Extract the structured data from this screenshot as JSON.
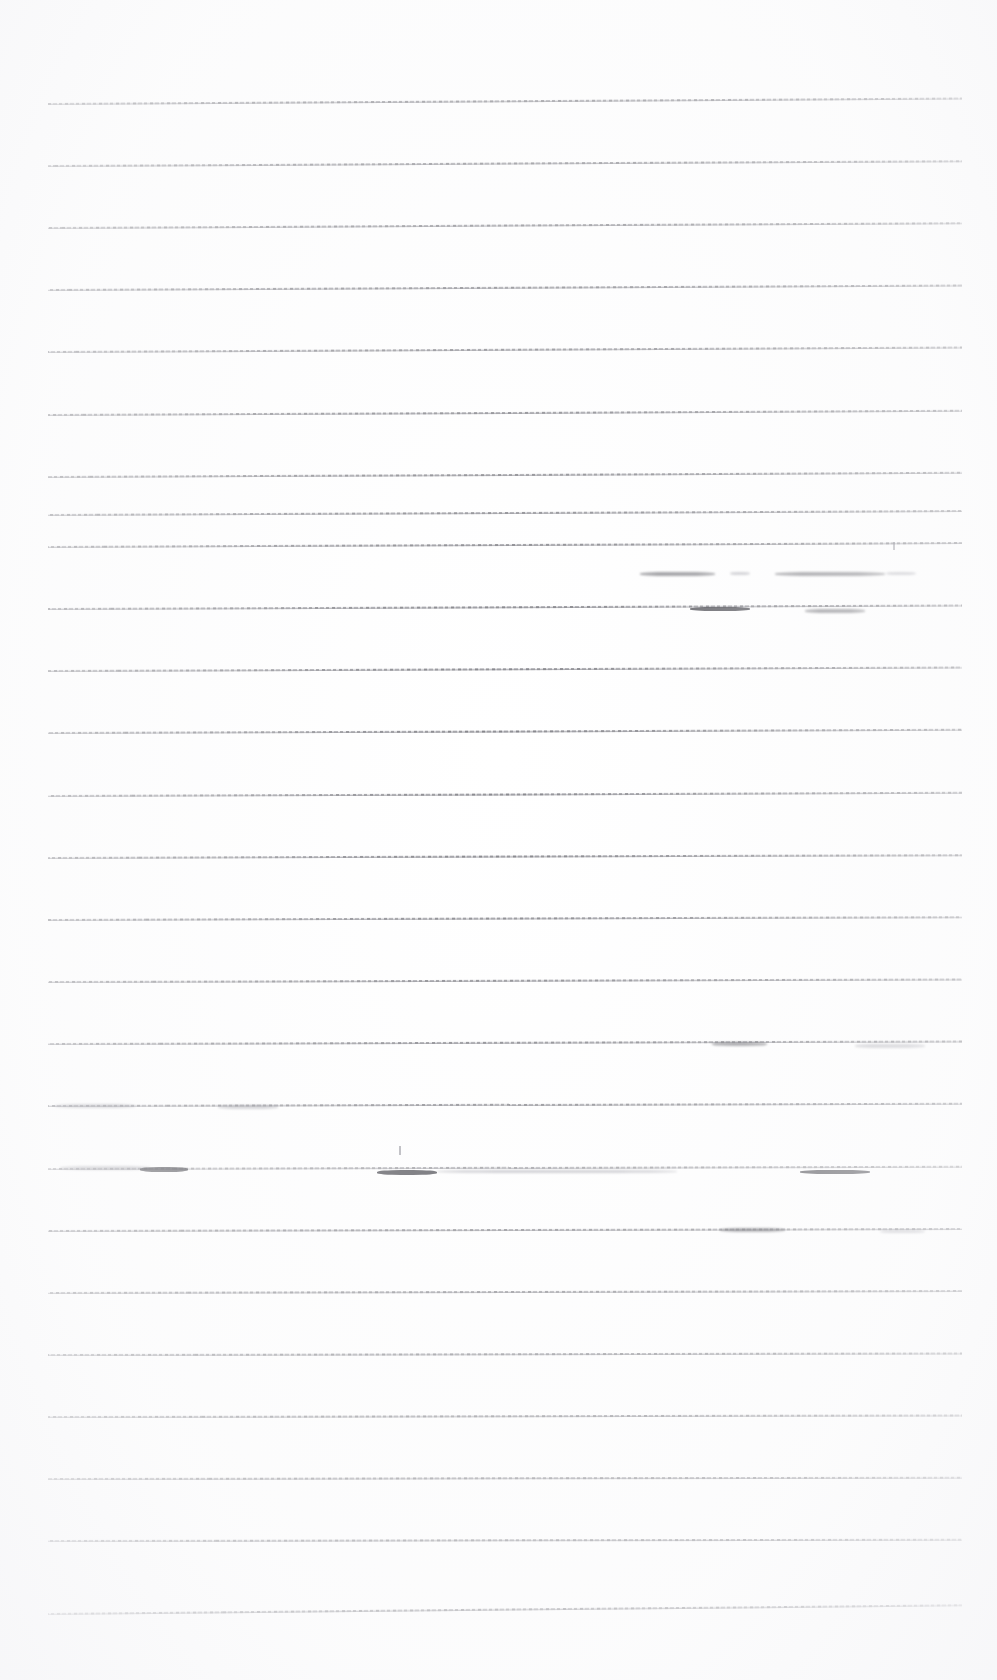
{
  "document": {
    "kind": "scanned-ruled-paper",
    "title": "Blank ruled notebook page (scan)",
    "page_width": 997,
    "page_height": 1680,
    "background_color": "#ffffff",
    "ink_color": "#46464e",
    "text_content": "",
    "visible_text": []
  },
  "ruling": {
    "description": "Horizontal ruled lines, faint grey, slightly skewed",
    "line_count": 25,
    "left_margin_x": 48,
    "right_margin_x": 962,
    "first_line_y": 103,
    "line_spacing": 62.1,
    "line_color": "#46464e",
    "line_thickness": 1
  },
  "lines": [
    {
      "id": "rule-1",
      "y": 103,
      "x1": 48,
      "x2": 962,
      "skew": -0.35,
      "opacity": 0.8,
      "segments": []
    },
    {
      "id": "rule-2",
      "y": 165,
      "x1": 48,
      "x2": 962,
      "skew": -0.3,
      "opacity": 0.78,
      "segments": []
    },
    {
      "id": "rule-3",
      "y": 227,
      "x1": 48,
      "x2": 962,
      "skew": -0.3,
      "opacity": 0.76,
      "segments": []
    },
    {
      "id": "rule-4",
      "y": 289,
      "x1": 48,
      "x2": 962,
      "skew": -0.28,
      "opacity": 0.78,
      "segments": []
    },
    {
      "id": "rule-5",
      "y": 351,
      "x1": 48,
      "x2": 962,
      "skew": -0.28,
      "opacity": 0.74,
      "segments": []
    },
    {
      "id": "rule-6",
      "y": 414,
      "x1": 48,
      "x2": 962,
      "skew": -0.26,
      "opacity": 0.76,
      "segments": []
    },
    {
      "id": "rule-7",
      "y": 476,
      "x1": 48,
      "x2": 962,
      "skew": -0.26,
      "opacity": 0.74,
      "segments": []
    },
    {
      "id": "rule-8",
      "y": 514,
      "x1": 48,
      "x2": 962,
      "skew": -0.25,
      "opacity": 0.72,
      "segments": []
    },
    {
      "id": "rule-9",
      "y": 546,
      "x1": 48,
      "x2": 962,
      "skew": -0.25,
      "opacity": 0.74,
      "segments": []
    },
    {
      "id": "rule-10",
      "y": 608,
      "x1": 48,
      "x2": 962,
      "skew": -0.22,
      "opacity": 0.76,
      "segments": []
    },
    {
      "id": "rule-11",
      "y": 670,
      "x1": 48,
      "x2": 962,
      "skew": -0.22,
      "opacity": 0.74,
      "segments": []
    },
    {
      "id": "rule-12",
      "y": 732,
      "x1": 48,
      "x2": 962,
      "skew": -0.2,
      "opacity": 0.74,
      "segments": []
    },
    {
      "id": "rule-13",
      "y": 795,
      "x1": 48,
      "x2": 962,
      "skew": -0.2,
      "opacity": 0.72,
      "segments": []
    },
    {
      "id": "rule-14",
      "y": 857,
      "x1": 48,
      "x2": 962,
      "skew": -0.18,
      "opacity": 0.74,
      "segments": []
    },
    {
      "id": "rule-15",
      "y": 919,
      "x1": 48,
      "x2": 962,
      "skew": -0.18,
      "opacity": 0.72,
      "segments": []
    },
    {
      "id": "rule-16",
      "y": 981,
      "x1": 48,
      "x2": 962,
      "skew": -0.16,
      "opacity": 0.72,
      "segments": []
    },
    {
      "id": "rule-17",
      "y": 1043,
      "x1": 48,
      "x2": 962,
      "skew": -0.16,
      "opacity": 0.74,
      "segments": []
    },
    {
      "id": "rule-18",
      "y": 1105,
      "x1": 48,
      "x2": 962,
      "skew": -0.14,
      "opacity": 0.72,
      "segments": []
    },
    {
      "id": "rule-19",
      "y": 1168,
      "x1": 48,
      "x2": 962,
      "skew": -0.14,
      "opacity": 0.6,
      "segments": []
    },
    {
      "id": "rule-20",
      "y": 1230,
      "x1": 48,
      "x2": 962,
      "skew": -0.12,
      "opacity": 0.72,
      "segments": []
    },
    {
      "id": "rule-21",
      "y": 1292,
      "x1": 48,
      "x2": 962,
      "skew": -0.12,
      "opacity": 0.72,
      "segments": []
    },
    {
      "id": "rule-22",
      "y": 1354,
      "x1": 48,
      "x2": 962,
      "skew": -0.1,
      "opacity": 0.72,
      "segments": []
    },
    {
      "id": "rule-23",
      "y": 1416,
      "x1": 48,
      "x2": 962,
      "skew": -0.1,
      "opacity": 0.72,
      "segments": []
    },
    {
      "id": "rule-24",
      "y": 1478,
      "x1": 48,
      "x2": 962,
      "skew": -0.08,
      "opacity": 0.72,
      "segments": []
    },
    {
      "id": "rule-25",
      "y": 1540,
      "x1": 48,
      "x2": 962,
      "skew": -0.08,
      "opacity": 0.72,
      "segments": []
    },
    {
      "id": "rule-26",
      "y": 1613,
      "x1": 48,
      "x2": 962,
      "skew": -0.55,
      "opacity": 0.7,
      "segments": []
    }
  ],
  "marks": [
    {
      "id": "smudge-1",
      "kind": "smudge",
      "x": 640,
      "y": 572,
      "w": 75,
      "h": 4,
      "weight": "normal"
    },
    {
      "id": "smudge-2",
      "kind": "smudge",
      "x": 730,
      "y": 572,
      "w": 20,
      "h": 3,
      "weight": "light"
    },
    {
      "id": "smudge-3",
      "kind": "smudge",
      "x": 775,
      "y": 572,
      "w": 110,
      "h": 4,
      "weight": "normal"
    },
    {
      "id": "smudge-4",
      "kind": "smudge",
      "x": 886,
      "y": 572,
      "w": 30,
      "h": 3,
      "weight": "light"
    },
    {
      "id": "smudge-5",
      "kind": "smudge",
      "x": 690,
      "y": 607,
      "w": 60,
      "h": 4,
      "weight": "heavy"
    },
    {
      "id": "smudge-6",
      "kind": "smudge",
      "x": 805,
      "y": 609,
      "w": 60,
      "h": 4,
      "weight": "normal"
    },
    {
      "id": "speck-1",
      "kind": "speck",
      "x": 893,
      "y": 542,
      "w": 2,
      "h": 8,
      "weight": "light"
    },
    {
      "id": "smudge-7",
      "kind": "smudge",
      "x": 712,
      "y": 1042,
      "w": 55,
      "h": 4,
      "weight": "normal"
    },
    {
      "id": "smudge-8",
      "kind": "smudge",
      "x": 855,
      "y": 1044,
      "w": 70,
      "h": 4,
      "weight": "light"
    },
    {
      "id": "smudge-9",
      "kind": "smudge",
      "x": 55,
      "y": 1104,
      "w": 80,
      "h": 4,
      "weight": "light"
    },
    {
      "id": "smudge-10",
      "kind": "smudge",
      "x": 218,
      "y": 1105,
      "w": 60,
      "h": 4,
      "weight": "light"
    },
    {
      "id": "speck-2",
      "kind": "speck",
      "x": 399,
      "y": 1146,
      "w": 2,
      "h": 9,
      "weight": "light"
    },
    {
      "id": "smudge-11",
      "kind": "smudge",
      "x": 60,
      "y": 1166,
      "w": 90,
      "h": 4,
      "weight": "light"
    },
    {
      "id": "smudge-12",
      "kind": "smudge",
      "x": 140,
      "y": 1167,
      "w": 48,
      "h": 5,
      "weight": "heavy"
    },
    {
      "id": "smudge-13",
      "kind": "smudge",
      "x": 377,
      "y": 1170,
      "w": 60,
      "h": 5,
      "weight": "heavy"
    },
    {
      "id": "smudge-14",
      "kind": "smudge",
      "x": 437,
      "y": 1170,
      "w": 240,
      "h": 3,
      "weight": "light"
    },
    {
      "id": "smudge-15",
      "kind": "smudge",
      "x": 800,
      "y": 1170,
      "w": 70,
      "h": 4,
      "weight": "heavy"
    },
    {
      "id": "smudge-16",
      "kind": "smudge",
      "x": 720,
      "y": 1228,
      "w": 65,
      "h": 4,
      "weight": "normal"
    },
    {
      "id": "smudge-17",
      "kind": "smudge",
      "x": 880,
      "y": 1230,
      "w": 45,
      "h": 3,
      "weight": "light"
    }
  ]
}
